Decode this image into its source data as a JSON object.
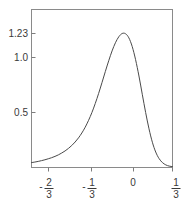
{
  "chart_data": {
    "type": "line",
    "title": "",
    "subtitle": "",
    "xlabel": "",
    "ylabel": "",
    "grid": false,
    "legend": null,
    "xlim": [
      -0.8333,
      0.3333
    ],
    "ylim": [
      0,
      1.34
    ],
    "x_tick_labels": [
      "-2/3",
      "-1/3",
      "0",
      "1/3"
    ],
    "x_tick_values": [
      -0.6667,
      -0.3333,
      0,
      0.3333
    ],
    "y_tick_labels": [
      "1.23",
      "1.0",
      "0.5"
    ],
    "y_tick_values": [
      1.23,
      1.0,
      0.5
    ],
    "peak": {
      "x": -0.0833,
      "y": 1.23
    },
    "series": [
      {
        "name": "density",
        "x": [
          -0.8333,
          -0.8056,
          -0.7778,
          -0.75,
          -0.7222,
          -0.6944,
          -0.6667,
          -0.6389,
          -0.6111,
          -0.5833,
          -0.5556,
          -0.5278,
          -0.5,
          -0.4722,
          -0.4444,
          -0.4167,
          -0.3889,
          -0.3611,
          -0.3333,
          -0.3056,
          -0.2778,
          -0.25,
          -0.2222,
          -0.1944,
          -0.1667,
          -0.1389,
          -0.1111,
          -0.0833,
          -0.0556,
          -0.0278,
          0,
          0.0278,
          0.0556,
          0.0833,
          0.1111,
          0.1389,
          0.1667,
          0.1944,
          0.2222,
          0.25,
          0.2778,
          0.3056,
          0.3333
        ],
        "y": [
          0.045,
          0.05,
          0.056,
          0.063,
          0.071,
          0.08,
          0.09,
          0.102,
          0.116,
          0.133,
          0.152,
          0.175,
          0.202,
          0.234,
          0.272,
          0.317,
          0.37,
          0.433,
          0.505,
          0.588,
          0.68,
          0.78,
          0.882,
          0.98,
          1.07,
          1.145,
          1.2,
          1.23,
          1.228,
          1.19,
          1.11,
          0.99,
          0.84,
          0.672,
          0.505,
          0.355,
          0.232,
          0.142,
          0.082,
          0.045,
          0.024,
          0.013,
          0.008
        ]
      }
    ]
  },
  "axes": {
    "y_labels": [
      {
        "text": "1.23",
        "value": 1.23
      },
      {
        "text": "1.0",
        "value": 1.0
      },
      {
        "text": "0.5",
        "value": 0.5
      }
    ],
    "x_labels": [
      {
        "sign": "-",
        "numerator": "2",
        "denominator": "3",
        "plain": "-2/3",
        "value": -0.6667
      },
      {
        "sign": "-",
        "numerator": "1",
        "denominator": "3",
        "plain": "-1/3",
        "value": -0.3333
      },
      {
        "sign": "",
        "numerator": "0",
        "denominator": "",
        "plain": "0",
        "value": 0
      },
      {
        "sign": "",
        "numerator": "1",
        "denominator": "3",
        "plain": "1/3",
        "value": 0.3333
      }
    ]
  },
  "colors": {
    "curve": "#4a4a4a",
    "frame": "#8a8a8a",
    "tick": "#7d7d7d",
    "text": "#3a3a3a",
    "background": "#ffffff"
  }
}
